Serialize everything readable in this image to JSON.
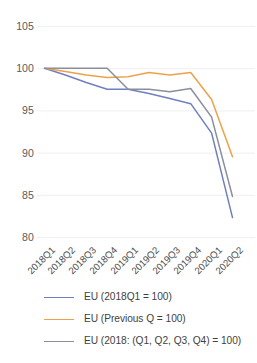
{
  "chart_data": {
    "type": "line",
    "title": "",
    "subtitle": "",
    "xlabel": "",
    "ylabel": "",
    "categories": [
      "2018Q1",
      "2018Q2",
      "2018Q3",
      "2018Q4",
      "2019Q1",
      "2019Q2",
      "2019Q3",
      "2019Q4",
      "2020Q1",
      "2020Q2"
    ],
    "ylim": [
      80,
      105
    ],
    "yticks": [
      80,
      85,
      90,
      95,
      100,
      105
    ],
    "ytick_labels": [
      "80",
      "85",
      "90",
      "95",
      "100",
      "105"
    ],
    "grid": "horizontal",
    "legend_position": "bottom",
    "series": [
      {
        "name": "EU (2018Q1 = 100)",
        "color": "#6f7fbf",
        "values": [
          100.0,
          99.2,
          98.3,
          97.5,
          97.5,
          97.0,
          96.4,
          95.8,
          92.3,
          82.3
        ]
      },
      {
        "name": "EU (Previous Q = 100)",
        "color": "#eda24a",
        "values": [
          100.0,
          99.6,
          99.2,
          98.9,
          99.0,
          99.5,
          99.2,
          99.5,
          96.3,
          89.5
        ]
      },
      {
        "name": "EU (2018: (Q1, Q2, Q3, Q4) = 100)",
        "color": "#8b8e9c",
        "values": [
          100.0,
          100.0,
          100.0,
          100.0,
          97.5,
          97.5,
          97.2,
          97.6,
          94.2,
          84.8
        ]
      }
    ]
  },
  "legend": {
    "items": [
      {
        "label": "EU (2018Q1 = 100)",
        "color": "#6f7fbf"
      },
      {
        "label": "EU (Previous Q = 100)",
        "color": "#eda24a"
      },
      {
        "label": "EU (2018: (Q1, Q2, Q3, Q4) = 100)",
        "color": "#8b8e9c"
      }
    ]
  },
  "axes": {
    "y_tick_labels": [
      "105",
      "100",
      "95",
      "90",
      "85",
      "80"
    ],
    "x_tick_labels": [
      "2018Q1",
      "2018Q2",
      "2018Q3",
      "2018Q4",
      "2019Q1",
      "2019Q2",
      "2019Q3",
      "2019Q4",
      "2020Q1",
      "2020Q2"
    ]
  },
  "style": {
    "gridline_color": "#efeff2",
    "axis_text_color": "#595959",
    "background": "#ffffff"
  }
}
